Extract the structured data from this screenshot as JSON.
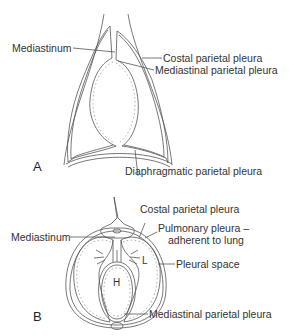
{
  "figure": {
    "panel_a": {
      "letter": "A",
      "labels": {
        "mediastinum": "Mediastinum",
        "costal": "Costal parietal pleura",
        "mediastinal": "Mediastinal parietal pleura",
        "diaphragmatic": "Diaphragmatic parietal pleura"
      }
    },
    "panel_b": {
      "letter": "B",
      "labels": {
        "costal": "Costal parietal pleura",
        "pulmonary_line1": "Pulmonary pleura –",
        "pulmonary_line2": "adherent to lung",
        "mediastinum": "Mediastinum",
        "pleural_space": "Pleural space",
        "mediastinal": "Mediastinal parietal pleura",
        "heart": "H",
        "lung": "L"
      }
    },
    "colors": {
      "line": "#555555",
      "dash": "#9a9a9a",
      "background": "#ffffff"
    }
  }
}
